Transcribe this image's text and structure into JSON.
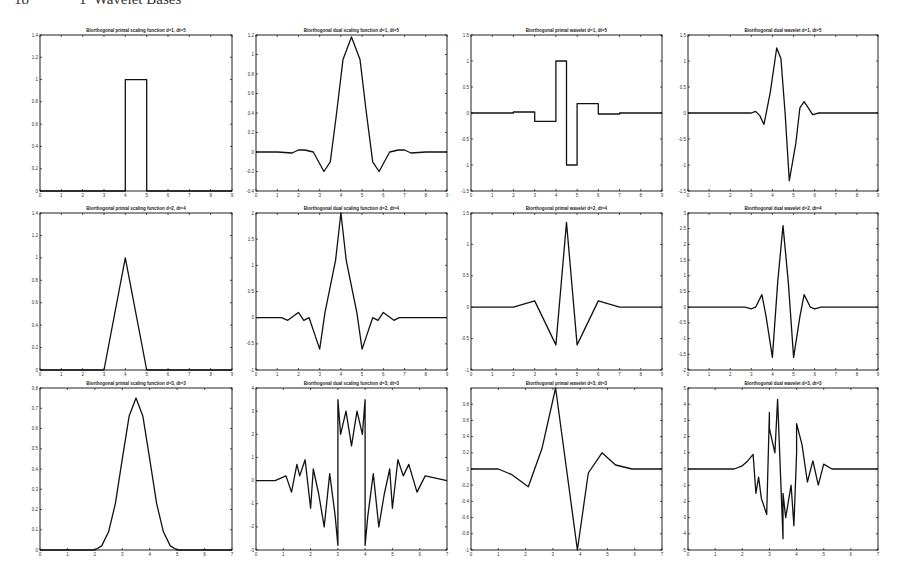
{
  "page": {
    "number": "18",
    "chapter_title": "1  Wavelet Bases"
  },
  "chart_data": [
    {
      "type": "line",
      "title": "Biorthogonal primal scaling function d=1, dt=5",
      "xlim": [
        0,
        9
      ],
      "ylim": [
        0,
        1.4
      ],
      "xticks": [
        0,
        1,
        2,
        3,
        4,
        5,
        6,
        7,
        8,
        9
      ],
      "yticks": [
        0,
        0.2,
        0.4,
        0.6,
        0.8,
        1,
        1.2,
        1.4
      ],
      "x": [
        0,
        4,
        4,
        5,
        5,
        9
      ],
      "y": [
        0,
        0,
        1,
        1,
        0,
        0
      ]
    },
    {
      "type": "line",
      "title": "Biorthogonal dual scaling function d=1, dt=5",
      "xlim": [
        0,
        9
      ],
      "ylim": [
        -0.4,
        1.2
      ],
      "xticks": [
        0,
        1,
        2,
        3,
        4,
        5,
        6,
        7,
        8,
        9
      ],
      "yticks": [
        -0.4,
        -0.2,
        0,
        0.2,
        0.4,
        0.6,
        0.8,
        1,
        1.2
      ],
      "x": [
        0,
        1,
        1.7,
        2,
        2.3,
        2.7,
        3,
        3.2,
        3.5,
        3.8,
        4.1,
        4.5,
        4.9,
        5.2,
        5.5,
        5.8,
        6,
        6.3,
        6.7,
        7,
        7.3,
        8,
        9
      ],
      "y": [
        0,
        0,
        -0.01,
        0.02,
        0.02,
        0,
        -0.12,
        -0.2,
        -0.1,
        0.4,
        0.95,
        1.18,
        0.95,
        0.4,
        -0.1,
        -0.2,
        -0.12,
        0,
        0.02,
        0.02,
        -0.01,
        0,
        0
      ]
    },
    {
      "type": "line",
      "title": "Biorthogonal primal wavelet d=1, dt=5",
      "xlim": [
        0,
        9
      ],
      "ylim": [
        -1.5,
        1.5
      ],
      "xticks": [
        0,
        1,
        2,
        3,
        4,
        5,
        6,
        7,
        8,
        9
      ],
      "yticks": [
        -1.5,
        -1,
        -0.5,
        0,
        0.5,
        1,
        1.5
      ],
      "x": [
        0,
        2,
        2,
        3,
        3,
        4,
        4,
        4.5,
        4.5,
        5,
        5,
        6,
        6,
        7,
        7,
        9
      ],
      "y": [
        0,
        0,
        0.02,
        0.02,
        -0.16,
        -0.16,
        1,
        1,
        -1,
        -1,
        0.18,
        0.18,
        -0.02,
        -0.02,
        0,
        0
      ]
    },
    {
      "type": "line",
      "title": "Biorthogonal dual wavelet d=1, dt=5",
      "xlim": [
        0,
        9
      ],
      "ylim": [
        -1.5,
        1.5
      ],
      "xticks": [
        0,
        1,
        2,
        3,
        4,
        5,
        6,
        7,
        8,
        9
      ],
      "yticks": [
        -1.5,
        -1,
        -0.5,
        0,
        0.5,
        1,
        1.5
      ],
      "x": [
        0,
        3,
        3.2,
        3.4,
        3.6,
        3.9,
        4.2,
        4.4,
        4.6,
        4.8,
        5.1,
        5.3,
        5.5,
        5.7,
        5.9,
        6.2,
        9
      ],
      "y": [
        0,
        0,
        0.03,
        -0.05,
        -0.22,
        0.4,
        1.25,
        1.05,
        0,
        -1.3,
        -0.6,
        0.1,
        0.22,
        0.1,
        -0.03,
        0,
        0
      ]
    },
    {
      "type": "line",
      "title": "Biorthogonal primal scaling function d=2, dt=4",
      "xlim": [
        0,
        9
      ],
      "ylim": [
        0,
        1.4
      ],
      "xticks": [
        0,
        1,
        2,
        3,
        4,
        5,
        6,
        7,
        8,
        9
      ],
      "yticks": [
        0,
        0.2,
        0.4,
        0.6,
        0.8,
        1,
        1.2,
        1.4
      ],
      "x": [
        0,
        3,
        4,
        5,
        9
      ],
      "y": [
        0,
        0,
        1,
        0,
        0
      ]
    },
    {
      "type": "line",
      "title": "Biorthogonal dual scaling function d=2, dt=4",
      "xlim": [
        0,
        9
      ],
      "ylim": [
        -1,
        2
      ],
      "xticks": [
        0,
        1,
        2,
        3,
        4,
        5,
        6,
        7,
        8,
        9
      ],
      "yticks": [
        -1,
        -0.5,
        0,
        0.5,
        1,
        1.5,
        2
      ],
      "x": [
        0,
        1.2,
        1.5,
        2,
        2.25,
        2.5,
        2.75,
        3,
        3.25,
        3.5,
        3.75,
        4,
        4.25,
        4.5,
        4.75,
        5,
        5.25,
        5.5,
        5.75,
        6,
        6.5,
        6.75,
        7,
        9
      ],
      "y": [
        0,
        0,
        -0.05,
        0.1,
        -0.05,
        0,
        -0.3,
        -0.6,
        0.1,
        0.6,
        1.1,
        2,
        1.1,
        0.6,
        0.1,
        -0.6,
        -0.3,
        0,
        -0.05,
        0.1,
        -0.05,
        0,
        0,
        0
      ]
    },
    {
      "type": "line",
      "title": "Biorthogonal primal wavelet d=2, dt=4",
      "xlim": [
        0,
        9
      ],
      "ylim": [
        -1,
        1.5
      ],
      "xticks": [
        0,
        1,
        2,
        3,
        4,
        5,
        6,
        7,
        8,
        9
      ],
      "yticks": [
        -1,
        -0.5,
        0,
        0.5,
        1,
        1.5
      ],
      "x": [
        0,
        2,
        3,
        4,
        4.5,
        5,
        6,
        7,
        9
      ],
      "y": [
        0,
        0,
        0.1,
        -0.6,
        1.35,
        -0.6,
        0.1,
        0,
        0
      ]
    },
    {
      "type": "line",
      "title": "Biorthogonal dual wavelet d=2, dt=4",
      "xlim": [
        0,
        9
      ],
      "ylim": [
        -2,
        3
      ],
      "xticks": [
        0,
        1,
        2,
        3,
        4,
        5,
        6,
        7,
        8,
        9
      ],
      "yticks": [
        -2,
        -1.5,
        -1,
        -0.5,
        0,
        0.5,
        1,
        1.5,
        2,
        2.5,
        3
      ],
      "x": [
        0,
        2.7,
        3,
        3.2,
        3.5,
        3.7,
        4,
        4.25,
        4.5,
        4.75,
        5,
        5.3,
        5.5,
        5.8,
        6,
        6.3,
        9
      ],
      "y": [
        0,
        0,
        -0.05,
        0,
        0.4,
        -0.3,
        -1.6,
        0.8,
        2.6,
        0.8,
        -1.6,
        -0.3,
        0.4,
        0,
        -0.05,
        0,
        0
      ]
    },
    {
      "type": "line",
      "title": "Biorthogonal primal scaling function d=3, dt=3",
      "xlim": [
        0,
        7
      ],
      "ylim": [
        0,
        0.8
      ],
      "xticks": [
        0,
        1,
        2,
        3,
        4,
        5,
        6,
        7
      ],
      "yticks": [
        0,
        0.1,
        0.2,
        0.3,
        0.4,
        0.5,
        0.6,
        0.7,
        0.8
      ],
      "x": [
        0,
        2,
        2.25,
        2.5,
        2.75,
        3,
        3.25,
        3.5,
        3.75,
        4,
        4.25,
        4.5,
        4.75,
        5,
        7
      ],
      "y": [
        0,
        0,
        0.02,
        0.09,
        0.23,
        0.45,
        0.66,
        0.75,
        0.66,
        0.45,
        0.23,
        0.09,
        0.02,
        0,
        0
      ]
    },
    {
      "type": "line",
      "title": "Biorthogonal dual scaling function d=3, dt=3",
      "xlim": [
        0,
        7
      ],
      "ylim": [
        -3,
        4
      ],
      "xticks": [
        0,
        1,
        2,
        3,
        4,
        5,
        6,
        7
      ],
      "yticks": [
        -3,
        -2,
        -1,
        0,
        1,
        2,
        3,
        4
      ],
      "x": [
        0,
        0.7,
        1.1,
        1.3,
        1.5,
        1.6,
        1.8,
        2,
        2.1,
        2.3,
        2.5,
        2.7,
        2.9,
        3,
        3,
        3.1,
        3.3,
        3.5,
        3.7,
        3.9,
        4,
        4,
        4.1,
        4.3,
        4.5,
        4.7,
        4.9,
        5,
        5.2,
        5.4,
        5.6,
        5.9,
        6.2,
        7
      ],
      "y": [
        0,
        0,
        0.2,
        -0.5,
        0.7,
        0.2,
        0.9,
        -1.2,
        0.5,
        -0.6,
        -2,
        0.3,
        -1.5,
        -2.8,
        3.5,
        2.0,
        3.0,
        1.5,
        3.0,
        2.0,
        3.5,
        -2.8,
        -1.5,
        0.3,
        -2,
        -0.6,
        0.5,
        -1.2,
        0.9,
        0.2,
        0.7,
        -0.5,
        0.2,
        0
      ]
    },
    {
      "type": "line",
      "title": "Biorthogonal primal wavelet d=3, dt=3",
      "xlim": [
        0,
        7
      ],
      "ylim": [
        -1,
        1
      ],
      "xticks": [
        0,
        1,
        2,
        3,
        4,
        5,
        6,
        7
      ],
      "yticks": [
        -1,
        -0.8,
        -0.6,
        -0.4,
        -0.2,
        0,
        0.2,
        0.4,
        0.6,
        0.8
      ],
      "x": [
        0,
        1,
        1.5,
        2.1,
        2.6,
        3.1,
        3.5,
        3.9,
        4.3,
        4.8,
        5.3,
        5.9,
        7
      ],
      "y": [
        0,
        0,
        -0.07,
        -0.22,
        0.25,
        1,
        0,
        -1,
        -0.05,
        0.2,
        0.05,
        0,
        0
      ]
    },
    {
      "type": "line",
      "title": "Biorthogonal dual wavelet d=3, dt=3",
      "xlim": [
        0,
        7
      ],
      "ylim": [
        -5,
        5
      ],
      "xticks": [
        0,
        1,
        2,
        3,
        4,
        5,
        6,
        7
      ],
      "yticks": [
        -5,
        -4,
        -3,
        -2,
        -1,
        0,
        1,
        2,
        3,
        4,
        5
      ],
      "x": [
        0,
        1.7,
        2,
        2.2,
        2.4,
        2.5,
        2.6,
        2.7,
        2.9,
        3,
        3,
        3.2,
        3.3,
        3.5,
        3.5,
        3.6,
        3.8,
        3.9,
        4,
        4,
        4.2,
        4.4,
        4.6,
        4.8,
        5,
        5.3,
        7
      ],
      "y": [
        0,
        0,
        0.2,
        0.5,
        0.9,
        -1.5,
        -0.5,
        -1.8,
        -2.8,
        3.5,
        2.5,
        1.0,
        4.3,
        -4.3,
        -1.5,
        -3,
        -1.0,
        -3.5,
        1,
        2.8,
        1.5,
        -0.8,
        0.5,
        -1.0,
        0.3,
        0,
        0
      ]
    }
  ]
}
